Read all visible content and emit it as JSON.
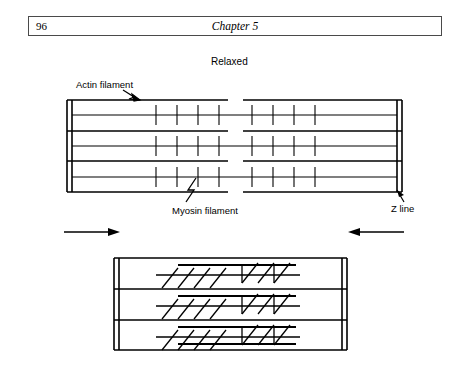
{
  "header": {
    "page_number": "96",
    "chapter_title": "Chapter 5"
  },
  "figure": {
    "state_label_relaxed": "Relaxed",
    "labels": {
      "actin_filament": "Actin filament",
      "myosin_filament": "Myosin filament",
      "z_line": "Z line"
    },
    "colors": {
      "ink": "#000000",
      "rule": "#4a4a4a"
    },
    "icons": {
      "actin_leader": "lightning-leader-icon",
      "myosin_leader": "lightning-leader-icon",
      "zline_leader": "arrow-leader-icon",
      "contraction_arrow_left": "arrow-right-icon",
      "contraction_arrow_right": "arrow-left-icon"
    },
    "relaxed_sarcomere": {
      "z_line_left_x": 66,
      "z_line_right_x": 400,
      "top_y": 100,
      "bottom_y": 192,
      "actin_rows": 4,
      "myosin_rows": 3,
      "crossbridges_per_half": 4,
      "h_zone_gap": true
    },
    "contracted_sarcomere": {
      "z_line_left_x": 113,
      "z_line_right_x": 345,
      "top_y": 258,
      "bottom_y": 350,
      "actin_rows": 4,
      "myosin_rows": 3,
      "crossbridges_per_half": 5,
      "crossbridges_angled": true
    }
  }
}
